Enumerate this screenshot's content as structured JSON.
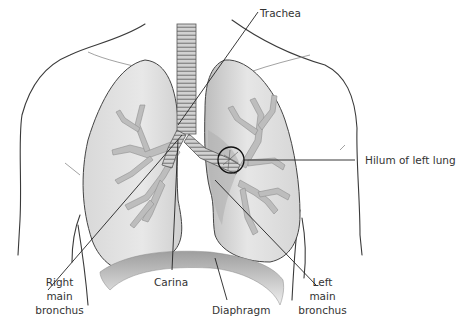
{
  "figure": {
    "colors": {
      "lung_fill_light": "#e6e6e6",
      "lung_fill_dark": "#c8c8c8",
      "mediastinal_shadow": "#a9a9a9",
      "bronchi": "#bdbdbd",
      "outline": "#3a3a3a",
      "diaphragm": "#c4c4c4"
    }
  },
  "labels": {
    "trachea": "Trachea",
    "hilum": "Hilum of left lung",
    "right_bronchus": [
      "Right",
      "main",
      "bronchus"
    ],
    "carina": "Carina",
    "diaphragm": "Diaphragm",
    "left_bronchus": [
      "Left",
      "main",
      "bronchus"
    ]
  }
}
